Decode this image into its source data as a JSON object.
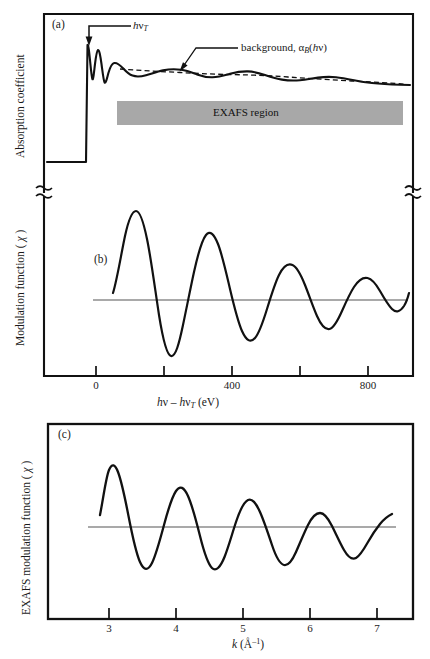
{
  "figure": {
    "background_color": "#ffffff",
    "line_color": "#111111",
    "band_color": "#a8a8a8",
    "baseline_color": "#555555"
  },
  "panel_a": {
    "letter": "(a)",
    "ylabel": "Absorption coefficient",
    "threshold_label_html": "<i class='it'>h</i>ν<sub class='sb'><i class='it'>T</i></sub>",
    "background_label_html": "background, α<sub class='sb'><i class='it'>B</i></sub>(<i class='it'>h</i>ν)",
    "band_text": "EXAFS region",
    "axis_break": true
  },
  "panel_b": {
    "letter": "(b)",
    "ylabel_html": "Modulation function ( <i class='it'>χ</i> )",
    "xlabel_html": "<i class='it'>h</i>ν – <i class='it'>h</i>ν<sub class='sb'><i class='it'>T</i></sub> (eV)",
    "xticks": [
      0,
      200,
      400,
      600,
      800
    ],
    "xtick_labels": [
      "0",
      "",
      "400",
      "",
      "800"
    ],
    "xlim": [
      -100,
      950
    ],
    "axis_break": true
  },
  "panel_c": {
    "letter": "(c)",
    "ylabel_html": "EXAFS modulation function ( <i class='it'>χ</i> )",
    "xlabel_html": "<i class='it'>k</i> (Å<sup class='sp'>–1</sup>)",
    "xticks": [
      3,
      4,
      5,
      6,
      7
    ],
    "xtick_labels": [
      "3",
      "4",
      "5",
      "6",
      "7"
    ],
    "xlim": [
      2.45,
      7.3
    ]
  },
  "chart_data": {
    "type": "line",
    "panels": [
      {
        "id": "a",
        "label": "(a)",
        "ylabel": "Absorption coefficient",
        "xlabel": "",
        "grid": false,
        "annotations": [
          {
            "text": "hν_T",
            "target": "absorption edge threshold",
            "type": "arrow-label"
          },
          {
            "text": "background, α_B(hν)",
            "target": "dashed smooth background curve",
            "type": "arrow-label"
          },
          {
            "text": "EXAFS region",
            "type": "shaded-band",
            "color": "#a8a8a8"
          }
        ],
        "series": [
          {
            "name": "absorption coefficient α(hν)",
            "style": "solid",
            "description": "flat pre-edge, sharp edge jump at hν_T, white-line peaks then damped EXAFS oscillations decaying to a slowly falling tail",
            "x": [
              -60,
              -5,
              0,
              2,
              5,
              8,
              11,
              14,
              17,
              21,
              25,
              30,
              36,
              42,
              50,
              60,
              72,
              86,
              100,
              118,
              140,
              165,
              195,
              230,
              270,
              315,
              365,
              420,
              480,
              545,
              615,
              690,
              770,
              855,
              940
            ],
            "y": [
              0.06,
              0.06,
              0.06,
              0.86,
              0.72,
              0.52,
              0.7,
              0.58,
              0.45,
              0.52,
              0.46,
              0.42,
              0.45,
              0.48,
              0.5,
              0.49,
              0.46,
              0.45,
              0.455,
              0.47,
              0.475,
              0.465,
              0.452,
              0.447,
              0.452,
              0.458,
              0.455,
              0.444,
              0.432,
              0.427,
              0.43,
              0.433,
              0.428,
              0.42,
              0.417
            ]
          },
          {
            "name": "background α_B(hν)",
            "style": "dashed",
            "description": "smooth monotonic background beneath the oscillations",
            "x": [
              60,
              100,
              140,
              195,
              270,
              365,
              480,
              615,
              770,
              940
            ],
            "y": [
              0.478,
              0.468,
              0.463,
              0.458,
              0.452,
              0.45,
              0.438,
              0.43,
              0.424,
              0.418
            ]
          }
        ]
      },
      {
        "id": "b",
        "label": "(b)",
        "ylabel": "Modulation function ( χ )",
        "xlabel": "hν – hν_T (eV)",
        "xlim": [
          -100,
          950
        ],
        "xticks": [
          0,
          200,
          400,
          600,
          800
        ],
        "xtick_labels": [
          "0",
          "",
          "400",
          "",
          "800"
        ],
        "grid": false,
        "series": [
          {
            "name": "modulation function χ(hν)",
            "style": "solid",
            "description": "damped oscillation vs photoelectron energy; amplitude decreases and period lengthens with energy",
            "x": [
              55,
              75,
              95,
              115,
              130,
              150,
              170,
              190,
              210,
              235,
              258,
              280,
              300,
              320,
              345,
              370,
              398,
              420,
              445,
              470,
              495,
              520,
              550,
              580,
              610,
              645,
              672,
              700,
              730,
              765,
              800,
              830,
              860,
              895,
              930
            ],
            "y": [
              0.12,
              0.55,
              0.96,
              1.0,
              0.62,
              -0.45,
              -0.92,
              -0.8,
              -0.1,
              0.66,
              0.82,
              0.6,
              0.05,
              -0.45,
              -0.7,
              -0.52,
              0.05,
              0.52,
              0.6,
              0.44,
              0.05,
              -0.32,
              -0.5,
              -0.4,
              -0.05,
              0.32,
              0.44,
              0.36,
              0.1,
              -0.14,
              -0.22,
              -0.18,
              -0.04,
              0.1,
              0.18
            ]
          },
          {
            "name": "zero baseline",
            "style": "thin-solid",
            "y_const": 0.0
          }
        ]
      },
      {
        "id": "c",
        "label": "(c)",
        "ylabel": "EXAFS modulation function ( χ )",
        "xlabel": "k (Å⁻¹)",
        "xlim": [
          2.45,
          7.3
        ],
        "xticks": [
          3,
          4,
          5,
          6,
          7
        ],
        "xtick_labels": [
          "3",
          "4",
          "5",
          "6",
          "7"
        ],
        "grid": false,
        "series": [
          {
            "name": "EXAFS χ(k)",
            "style": "solid",
            "description": "damped sinusoid in k-space, period roughly 1 Å⁻¹, amplitude decaying from k≈3 to k≈7",
            "x": [
              2.8,
              2.9,
              3.0,
              3.1,
              3.22,
              3.35,
              3.5,
              3.62,
              3.75,
              3.88,
              4.0,
              4.12,
              4.25,
              4.38,
              4.5,
              4.62,
              4.75,
              4.88,
              5.0,
              5.12,
              5.25,
              5.38,
              5.5,
              5.62,
              5.75,
              5.88,
              6.0,
              6.12,
              6.25,
              6.38,
              6.5,
              6.62,
              6.75,
              6.88,
              7.0
            ],
            "y": [
              0.12,
              0.7,
              1.0,
              0.92,
              0.38,
              -0.4,
              -0.92,
              -0.72,
              -0.18,
              0.48,
              0.82,
              0.7,
              0.2,
              -0.36,
              -0.62,
              -0.48,
              -0.02,
              0.44,
              0.62,
              0.5,
              0.08,
              -0.36,
              -0.52,
              -0.42,
              -0.02,
              0.32,
              0.44,
              0.34,
              0.06,
              -0.16,
              -0.24,
              -0.2,
              -0.06,
              0.1,
              0.18
            ]
          },
          {
            "name": "zero baseline",
            "style": "thin-solid",
            "y_const": 0.0
          }
        ]
      }
    ]
  }
}
